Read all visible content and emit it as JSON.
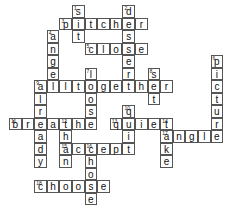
{
  "puzzle": {
    "type": "crossword",
    "grid": {
      "origin_x": 9.5,
      "origin_y": 5.5,
      "cell_w": 12.6,
      "cell_h": 12.5
    },
    "words": [
      {
        "num": "1",
        "answer": "sit",
        "dir": "down",
        "row": 0,
        "col": 5
      },
      {
        "num": "2",
        "answer": "dessert",
        "dir": "down",
        "row": 0,
        "col": 9
      },
      {
        "num": "3",
        "answer": "pitcher",
        "dir": "across",
        "row": 1,
        "col": 4
      },
      {
        "num": "4",
        "answer": "angel",
        "dir": "down",
        "row": 2,
        "col": 3
      },
      {
        "num": "5",
        "answer": "close",
        "dir": "across",
        "row": 3,
        "col": 6
      },
      {
        "num": "6",
        "answer": "picture",
        "dir": "down",
        "row": 4,
        "col": 16
      },
      {
        "num": "7",
        "answer": "loose",
        "dir": "down",
        "row": 5,
        "col": 6
      },
      {
        "num": "8",
        "answer": "set",
        "dir": "down",
        "row": 5,
        "col": 11
      },
      {
        "num": "9",
        "answer": "alltogether",
        "dir": "across",
        "row": 6,
        "col": 2
      },
      {
        "num": "9",
        "answer": "already",
        "dir": "down",
        "row": 6,
        "col": 2
      },
      {
        "num": "10",
        "answer": "quit",
        "dir": "down",
        "row": 8,
        "col": 9
      },
      {
        "num": "11",
        "answer": "breathe",
        "dir": "across",
        "row": 9,
        "col": 0
      },
      {
        "num": "12",
        "answer": "than",
        "dir": "down",
        "row": 9,
        "col": 4
      },
      {
        "num": "13",
        "answer": "quiet",
        "dir": "across",
        "row": 9,
        "col": 8
      },
      {
        "num": "14",
        "answer": "take",
        "dir": "down",
        "row": 9,
        "col": 12
      },
      {
        "num": "15",
        "answer": "accept",
        "dir": "across",
        "row": 11,
        "col": 4
      },
      {
        "num": "16",
        "answer": "chose",
        "dir": "down",
        "row": 11,
        "col": 6
      },
      {
        "num": "17",
        "answer": "angle",
        "dir": "across",
        "row": 10,
        "col": 12
      },
      {
        "num": "18",
        "answer": "choose",
        "dir": "across",
        "row": 14,
        "col": 2
      }
    ]
  }
}
